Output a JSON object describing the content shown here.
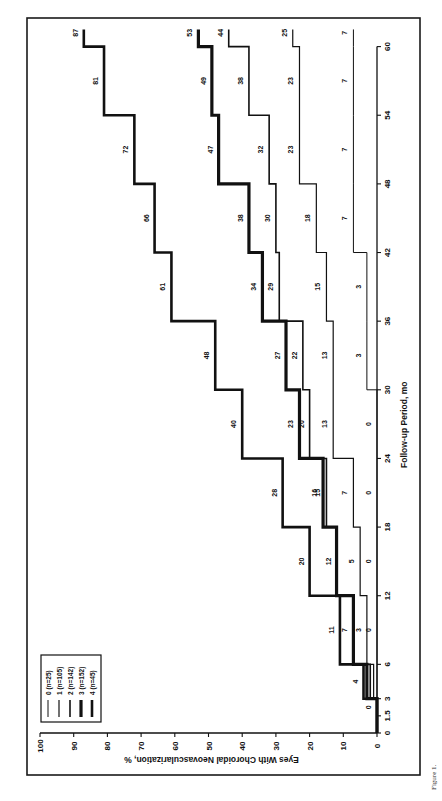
{
  "figure": {
    "caption_prefix": "Figure 1."
  },
  "chart_data": {
    "type": "line",
    "subtype": "step (cumulative incidence), rotated 90° counter-clockwise",
    "title": "",
    "xlabel": "Follow-up Period, mo",
    "ylabel": "Eyes With Choroidal Neovascularization, %",
    "xlim": [
      0,
      60
    ],
    "ylim": [
      0,
      100
    ],
    "x_ticks": [
      0,
      1.5,
      3,
      6,
      12,
      18,
      24,
      30,
      36,
      42,
      48,
      54,
      60
    ],
    "x_tick_labels": [
      "0",
      "1.5",
      "3",
      "6",
      "12",
      "18",
      "24",
      "30",
      "36",
      "42",
      "48",
      "54",
      "60"
    ],
    "y_ticks": [
      0,
      10,
      20,
      30,
      40,
      50,
      60,
      70,
      80,
      90,
      100
    ],
    "y_tick_labels": [
      "0",
      "10",
      "20",
      "30",
      "40",
      "50",
      "60",
      "70",
      "80",
      "90",
      "100"
    ],
    "grid": false,
    "legend_position": "upper-left (rotated: bottom-left of image)",
    "interval_starts": [
      0,
      1.5,
      3,
      6,
      12,
      18,
      24,
      30,
      36,
      42,
      48,
      54,
      60
    ],
    "series": [
      {
        "name": "0 (n=25)",
        "stroke_width": 1.0,
        "values": [
          0,
          0,
          0,
          0,
          0,
          0,
          0,
          3,
          3,
          7,
          7,
          7,
          7
        ],
        "labels": [
          "",
          "",
          "",
          "0",
          "0",
          "0",
          "0",
          "3",
          "3",
          "7",
          "7",
          "7",
          "7"
        ]
      },
      {
        "name": "1 (n=105)",
        "stroke_width": 1.2,
        "values": [
          0,
          0,
          1,
          3,
          5,
          7,
          13,
          13,
          15,
          18,
          23,
          23,
          25
        ],
        "labels": [
          "",
          "",
          "",
          "3",
          "5",
          "7",
          "13",
          "13",
          "15",
          "18",
          "23",
          "23",
          "25"
        ]
      },
      {
        "name": "2 (n=142)",
        "stroke_width": 1.6,
        "values": [
          0,
          0,
          2,
          7,
          12,
          15,
          20,
          22,
          29,
          30,
          32,
          38,
          44
        ],
        "labels": [
          "",
          "0",
          "",
          "7",
          "12",
          "15",
          "20",
          "22",
          "29",
          "30",
          "32",
          "38",
          "44"
        ]
      },
      {
        "name": "3 (n=152)",
        "stroke_width": 3.2,
        "values": [
          0,
          0,
          3,
          7,
          12,
          16,
          23,
          27,
          34,
          38,
          47,
          49,
          53
        ],
        "labels": [
          "",
          "",
          "",
          "",
          "",
          "16",
          "23",
          "27",
          "34",
          "38",
          "47",
          "49",
          "53"
        ]
      },
      {
        "name": "4 (n=45)",
        "stroke_width": 2.6,
        "values": [
          0,
          0,
          4,
          11,
          20,
          28,
          40,
          48,
          61,
          66,
          72,
          81,
          87
        ],
        "labels": [
          "",
          "",
          "4",
          "11",
          "20",
          "28",
          "40",
          "48",
          "61",
          "66",
          "72",
          "81",
          "87"
        ]
      }
    ]
  },
  "legend": {
    "items": [
      {
        "label": "0 (n=25)"
      },
      {
        "label": "1 (n=105)"
      },
      {
        "label": "2 (n=142)"
      },
      {
        "label": "3 (n=152)"
      },
      {
        "label": "4 (n=45)"
      }
    ]
  }
}
